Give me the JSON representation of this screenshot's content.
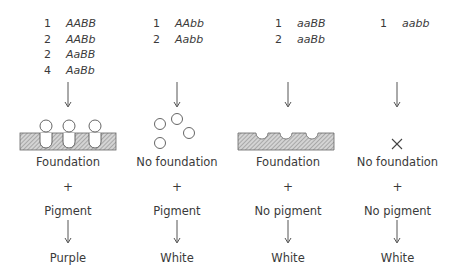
{
  "columns": [
    {
      "genotypes": [
        {
          "count": "1",
          "genotype": "AABB"
        },
        {
          "count": "2",
          "genotype": "AABb"
        },
        {
          "count": "2",
          "genotype": "AaBB"
        },
        {
          "count": "4",
          "genotype": "AaBb"
        }
      ],
      "structure_icon": "foundation-with-pigment",
      "foundation": "Foundation",
      "plus": "+",
      "pigment": "Pigment",
      "phenotype": "Purple"
    },
    {
      "genotypes": [
        {
          "count": "1",
          "genotype": "AAbb"
        },
        {
          "count": "2",
          "genotype": "Aabb"
        }
      ],
      "structure_icon": "loose-pigment-circles",
      "foundation": "No foundation",
      "plus": "+",
      "pigment": "Pigment",
      "phenotype": "White"
    },
    {
      "genotypes": [
        {
          "count": "1",
          "genotype": "aaBB"
        },
        {
          "count": "2",
          "genotype": "aaBb"
        }
      ],
      "structure_icon": "empty-foundation",
      "foundation": "Foundation",
      "plus": "+",
      "pigment": "No pigment",
      "phenotype": "White"
    },
    {
      "genotypes": [
        {
          "count": "1",
          "genotype": "aabb"
        }
      ],
      "structure_icon": "x-mark",
      "foundation": "No foundation",
      "plus": "+",
      "pigment": "No pigment",
      "phenotype": "White"
    }
  ],
  "colors": {
    "text": "#3a3a3a",
    "hatch_fill": "#bdbdbd",
    "stroke": "#555555"
  }
}
